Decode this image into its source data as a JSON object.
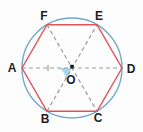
{
  "figure": {
    "vertex_labels": {
      "a": "A",
      "b": "B",
      "c": "C",
      "d": "D",
      "e": "E",
      "f": "F"
    },
    "center_label": "O",
    "colors": {
      "circle": "#73a9cb",
      "hexagon": "#e0525a",
      "diagonal": "#9b9b9b",
      "angle_fill": "#a9d5ec",
      "label_text": "#1f1f1f",
      "center_dot": "#1a1a1a",
      "background": "#fdfdfd"
    }
  }
}
